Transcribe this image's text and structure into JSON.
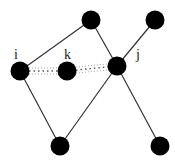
{
  "diagram": {
    "type": "graph",
    "nodes": [
      {
        "id": "top",
        "label": ""
      },
      {
        "id": "topright",
        "label": ""
      },
      {
        "id": "i",
        "label": "i"
      },
      {
        "id": "k",
        "label": "k"
      },
      {
        "id": "j",
        "label": "j"
      },
      {
        "id": "bottomleft",
        "label": ""
      },
      {
        "id": "bottomright",
        "label": ""
      }
    ],
    "edges": [
      {
        "from": "i",
        "to": "top",
        "style": "solid"
      },
      {
        "from": "top",
        "to": "j",
        "style": "solid"
      },
      {
        "from": "topright",
        "to": "j",
        "style": "solid"
      },
      {
        "from": "i",
        "to": "bottomleft",
        "style": "solid"
      },
      {
        "from": "bottomleft",
        "to": "j",
        "style": "solid"
      },
      {
        "from": "j",
        "to": "bottomright",
        "style": "solid"
      },
      {
        "from": "i",
        "to": "k",
        "style": "dotted"
      },
      {
        "from": "k",
        "to": "j",
        "style": "dotted"
      }
    ],
    "colors": {
      "node": "#000000",
      "edge": "#333333",
      "background": "#ffffff"
    }
  }
}
